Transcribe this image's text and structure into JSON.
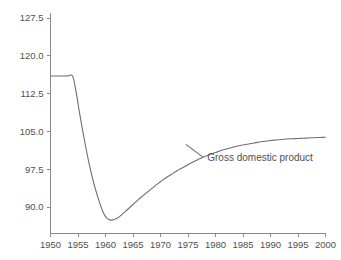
{
  "chart_data": {
    "type": "line",
    "title": "",
    "subtitle": "",
    "xlabel": "",
    "ylabel": "",
    "xlim": [
      1950,
      2000
    ],
    "ylim": [
      86.0,
      130.0
    ],
    "grid": false,
    "legend_position": "inline-annotation",
    "x_ticks": [
      1950,
      1955,
      1960,
      1965,
      1970,
      1975,
      1980,
      1985,
      1990,
      1995,
      2000
    ],
    "x_tick_labels": [
      "1950",
      "1955",
      "1960",
      "1965",
      "1970",
      "1975",
      "1980",
      "1985",
      "1990",
      "1995",
      "2000"
    ],
    "y_ticks": [
      90.0,
      97.5,
      105.0,
      112.5,
      120.0,
      127.5
    ],
    "y_tick_labels": [
      "90.0",
      "97.5",
      "105.0",
      "112.5",
      "120.0",
      "127.5"
    ],
    "series": [
      {
        "name": "Gross domestic product",
        "annotation": "Gross domestic product",
        "annotation_x": 1978.5,
        "annotation_y": 99.2,
        "color": "#6e6e6e",
        "x": [
          1950.0,
          1951.0,
          1952.0,
          1953.0,
          1954.0,
          1954.6,
          1955.2,
          1955.8,
          1956.4,
          1957.0,
          1957.6,
          1958.2,
          1958.8,
          1959.4,
          1960.0,
          1960.6,
          1961.2,
          1962.0,
          1963.0,
          1964.0,
          1965.0,
          1966.0,
          1967.0,
          1968.0,
          1969.0,
          1970.0,
          1971.0,
          1972.0,
          1973.0,
          1974.0,
          1975.0,
          1976.0,
          1977.0,
          1978.0,
          1979.0,
          1980.0,
          1981.0,
          1982.0,
          1983.0,
          1984.0,
          1985.0,
          1986.0,
          1987.0,
          1988.0,
          1989.0,
          1990.0,
          1991.0,
          1992.0,
          1993.0,
          1994.0,
          1995.0,
          1996.0,
          1997.0,
          1998.0,
          1999.0,
          2000.0
        ],
        "y": [
          116.0,
          116.0,
          116.0,
          116.0,
          116.0,
          113.2,
          109.2,
          105.4,
          101.9,
          98.7,
          95.9,
          93.4,
          91.3,
          89.4,
          88.1,
          87.5,
          87.4,
          87.7,
          88.5,
          89.5,
          90.5,
          91.5,
          92.4,
          93.3,
          94.2,
          95.0,
          95.8,
          96.5,
          97.2,
          97.8,
          98.4,
          99.0,
          99.5,
          100.0,
          100.4,
          100.8,
          101.2,
          101.5,
          101.8,
          102.1,
          102.3,
          102.5,
          102.7,
          102.9,
          103.05,
          103.2,
          103.3,
          103.4,
          103.5,
          103.55,
          103.6,
          103.65,
          103.7,
          103.75,
          103.8,
          103.85
        ]
      }
    ]
  },
  "axes": {
    "axis_color": "#8a8a8a",
    "tick_label_color": "#4f4f4f",
    "background": "#ffffff"
  }
}
